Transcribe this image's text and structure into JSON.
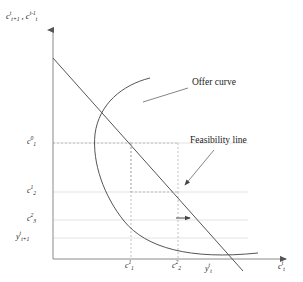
{
  "figure": {
    "type": "olg-offer-curve-diagram",
    "axes": {
      "y_axis_label_html": "c<sup>t</sup><sub>t+1</sub> , c<sup>t-1</sup><sub>t</sub>",
      "x_axis_label_html": "c<sup>t</sup><sub>t</sub>",
      "origin": [
        53,
        259
      ],
      "x_axis_end": [
        291,
        259
      ],
      "y_axis_top": [
        53,
        25
      ]
    },
    "annotations": [
      {
        "id": "offer-curve",
        "text": "Offer curve",
        "x": 192,
        "y": 84
      },
      {
        "id": "feasibility-line",
        "text": "Feasibility line",
        "x": 190,
        "y": 142
      }
    ],
    "y_ticks": [
      {
        "id": "c1-upper",
        "html": "c<sup>0</sup><sub>1</sub>",
        "y": 143
      },
      {
        "id": "c1-mid",
        "html": "c<sup>1</sup><sub>2</sub>",
        "y": 192
      },
      {
        "id": "c2-low",
        "html": "c<sup>2</sup><sub>3</sub>",
        "y": 220
      },
      {
        "id": "y-endow",
        "html": "y<sup>t</sup><sub>t+1</sub>",
        "y": 238
      }
    ],
    "x_ticks": [
      {
        "id": "c1",
        "html": "c<sup>1</sup><sub>1</sub>",
        "x": 131
      },
      {
        "id": "c2",
        "html": "c<sup>2</sup><sub>2</sub>",
        "x": 178
      },
      {
        "id": "yt",
        "html": "y<sup>t</sup><sub>t</sub>",
        "x": 211
      }
    ],
    "colors": {
      "curve": "#555555",
      "line": "#555555",
      "axis": "#888888",
      "grid": "#d8d8d8",
      "dashed": "#b0b0b0",
      "text": "#1a1a1a"
    }
  }
}
